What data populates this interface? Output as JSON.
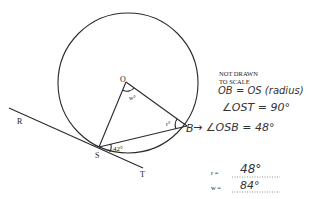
{
  "diagram": {
    "points": {
      "O": {
        "label": "O",
        "x": 126,
        "y": 82
      },
      "S": {
        "label": "S",
        "x": 99,
        "y": 147
      },
      "B": {
        "label": "B",
        "x": 187,
        "y": 126
      },
      "R": {
        "label": "R",
        "x": 18,
        "y": 122
      },
      "T": {
        "label": "T",
        "x": 143,
        "y": 175
      }
    },
    "circle": {
      "cx": 128,
      "cy": 83,
      "r": 70
    },
    "angles": {
      "w_label": "w°",
      "r_label": "r°",
      "given_label": "42°"
    },
    "note": {
      "line1": "NOT DRAWN",
      "line2": "TO SCALE"
    }
  },
  "working": {
    "line1": "OB = OS (radius)",
    "line2": "∠OST = 90°",
    "line3": "→ ∠OSB = 48°",
    "b_label": "B"
  },
  "answers": {
    "r_label": "r =",
    "r_value": "48°",
    "w_label": "w =",
    "w_value": "84°"
  }
}
